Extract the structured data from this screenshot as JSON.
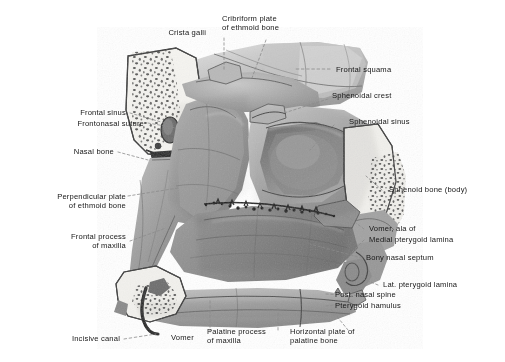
{
  "figure": {
    "background_color": "#ffffff",
    "ink_color": "#171717",
    "style": "grayscale halftone anatomical drawing with dashed leader lines"
  },
  "labels": [
    {
      "id": "crista-galli",
      "text": "Crista galli",
      "align": "right"
    },
    {
      "id": "cribriform-plate",
      "text": "Cribriform plate\nof ethmoid bone",
      "align": "left"
    },
    {
      "id": "frontal-squama",
      "text": "Frontal squama",
      "align": "left"
    },
    {
      "id": "sphenoidal-crest",
      "text": "Sphenoidal crest",
      "align": "left"
    },
    {
      "id": "sphenoidal-sinus",
      "text": "Sphenoidal sinus",
      "align": "left"
    },
    {
      "id": "sphenoid-bone-body",
      "text": "Sphenoid bone (body)",
      "align": "left"
    },
    {
      "id": "vomer-ala-of",
      "text": "Vomer, ala of",
      "align": "left"
    },
    {
      "id": "medial-pterygoid-lamina",
      "text": "Medial pterygoid lamina",
      "align": "left"
    },
    {
      "id": "bony-nasal-septum",
      "text": "Bony nasal septum",
      "align": "left"
    },
    {
      "id": "lat-pterygoid-lamina",
      "text": "Lat. pterygoid lamina",
      "align": "left"
    },
    {
      "id": "post-nasal-spine",
      "text": "Post. nasal spine",
      "align": "left"
    },
    {
      "id": "pterygoid-hamulus",
      "text": "Pterygoid hamulus",
      "align": "left"
    },
    {
      "id": "horizontal-plate",
      "text": "Horizontal plate of\npalatine bone",
      "align": "left"
    },
    {
      "id": "palatine-process",
      "text": "Palatine process\nof maxilla",
      "align": "left"
    },
    {
      "id": "vomer",
      "text": "Vomer",
      "align": "left"
    },
    {
      "id": "incisive-canal",
      "text": "Incisive canal",
      "align": "right"
    },
    {
      "id": "frontal-process-maxilla",
      "text": "Frontal process\nof maxilla",
      "align": "right"
    },
    {
      "id": "perpendicular-plate",
      "text": "Perpendicular plate\nof ethmoid bone",
      "align": "right"
    },
    {
      "id": "nasal-bone",
      "text": "Nasal bone",
      "align": "right"
    },
    {
      "id": "frontonasal-suture",
      "text": "Frontonasal suture",
      "align": "right"
    },
    {
      "id": "frontal-sinus",
      "text": "Frontal sinus",
      "align": "right"
    }
  ]
}
